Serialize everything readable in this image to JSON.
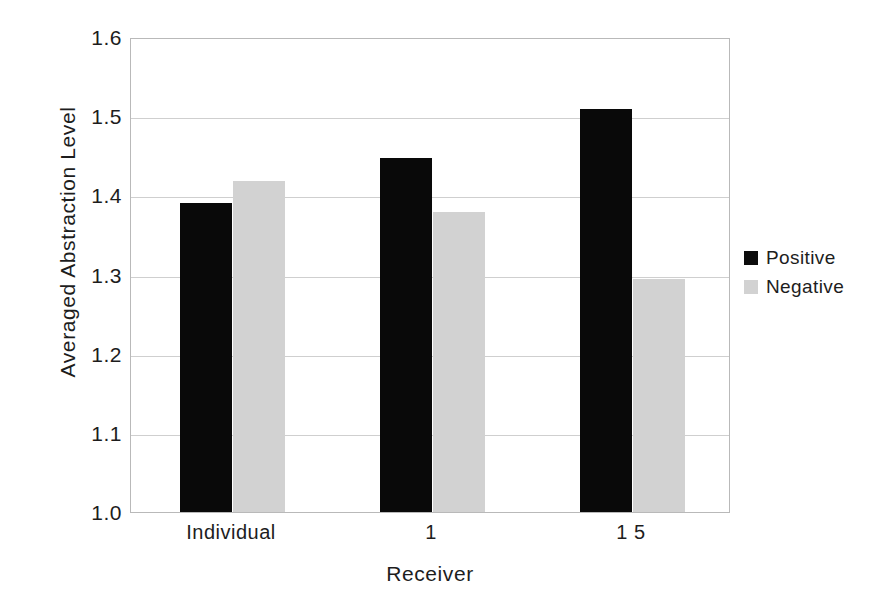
{
  "chart_data": {
    "type": "bar",
    "title": "",
    "xlabel": "Receiver",
    "ylabel": "Averaged Abstraction Level",
    "categories": [
      "Individual",
      "1",
      "1 5"
    ],
    "series": [
      {
        "name": "Positive",
        "color": "#090909",
        "values": [
          1.39,
          1.447,
          1.509
        ]
      },
      {
        "name": "Negative",
        "color": "#d2d2d2",
        "values": [
          1.418,
          1.379,
          1.294
        ]
      }
    ],
    "ylim": [
      1.0,
      1.6
    ],
    "ytick_labels": [
      "1.6",
      "1.5",
      "1.4",
      "1.3",
      "1.2",
      "1.1",
      "1.0"
    ],
    "ytick_values": [
      1.6,
      1.5,
      1.4,
      1.3,
      1.2,
      1.1,
      1.0
    ],
    "grid": true,
    "legend_position": "right"
  },
  "legend": {
    "entries": [
      {
        "label": "Positive",
        "swatch": "positive-swatch"
      },
      {
        "label": "Negative",
        "swatch": "negative-swatch"
      }
    ]
  }
}
